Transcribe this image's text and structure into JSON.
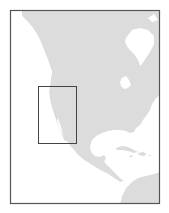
{
  "map": {
    "type": "locator-map",
    "region": "North America",
    "highlight": "US West Coast (California / Nevada)",
    "colors": {
      "land": "#dcdcdc",
      "water": "#ffffff",
      "frame": "#555555",
      "highlight_box": "#444444"
    },
    "features": [
      "north-america-landmass",
      "greenland",
      "hudson-bay",
      "great-lakes",
      "gulf-of-mexico",
      "baja-california",
      "central-america",
      "cuba",
      "hispaniola",
      "jamaica",
      "puerto-rico",
      "south-america"
    ]
  }
}
